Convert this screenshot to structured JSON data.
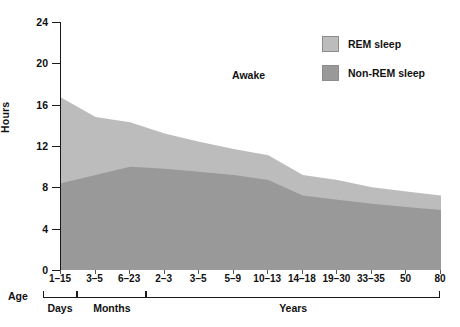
{
  "chart_data": {
    "type": "area",
    "title": "",
    "xlabel": "Age",
    "ylabel": "Hours",
    "ylim": [
      0,
      24
    ],
    "yticks": [
      0,
      4,
      8,
      12,
      16,
      20,
      24
    ],
    "grid": false,
    "stacked": true,
    "legend_position": "top-right",
    "categories": [
      "1–15",
      "3–5",
      "6–23",
      "2–3",
      "3–5",
      "5–9",
      "10–13",
      "14–18",
      "19–30",
      "33–35",
      "50",
      "80"
    ],
    "category_groups": [
      {
        "label": "Days",
        "from": "1–15",
        "to": "1–15"
      },
      {
        "label": "Months",
        "from": "3–5",
        "to": "6–23"
      },
      {
        "label": "Years",
        "from": "2–3",
        "to": "80"
      }
    ],
    "series": [
      {
        "name": "Non-REM sleep",
        "color": "#999999",
        "values": [
          8.4,
          9.2,
          10.0,
          9.8,
          9.5,
          9.2,
          8.7,
          7.2,
          6.8,
          6.4,
          6.1,
          5.8
        ]
      },
      {
        "name": "REM sleep",
        "color": "#bcbcbc",
        "values": [
          8.3,
          5.6,
          4.3,
          3.4,
          2.9,
          2.5,
          2.4,
          2.0,
          1.9,
          1.6,
          1.5,
          1.4
        ]
      }
    ],
    "totals": [
      16.7,
      14.8,
      14.3,
      13.2,
      12.4,
      11.7,
      11.1,
      9.2,
      8.7,
      8.0,
      7.6,
      7.2
    ],
    "annotations": [
      {
        "text": "Awake",
        "region": "above-total-curve"
      }
    ],
    "legend": [
      {
        "label": "REM sleep",
        "color": "#bcbcbc"
      },
      {
        "label": "Non-REM sleep",
        "color": "#999999"
      }
    ]
  },
  "axes": {
    "y_title": "Hours",
    "y_ticks": [
      "0",
      "4",
      "8",
      "12",
      "16",
      "20",
      "24"
    ],
    "x_ticks": [
      "1–15",
      "3–5",
      "6–23",
      "2–3",
      "3–5",
      "5–9",
      "10–13",
      "14–18",
      "19–30",
      "33–35",
      "50",
      "80"
    ],
    "x_title": "Age",
    "groups": [
      "Days",
      "Months",
      "Years"
    ]
  },
  "annotations": {
    "awake": "Awake"
  },
  "legend": {
    "rem": "REM sleep",
    "non_rem": "Non-REM sleep"
  },
  "colors": {
    "rem": "#bcbcbc",
    "non_rem": "#999999",
    "axis": "#1a1a1a",
    "background": "#ffffff"
  }
}
